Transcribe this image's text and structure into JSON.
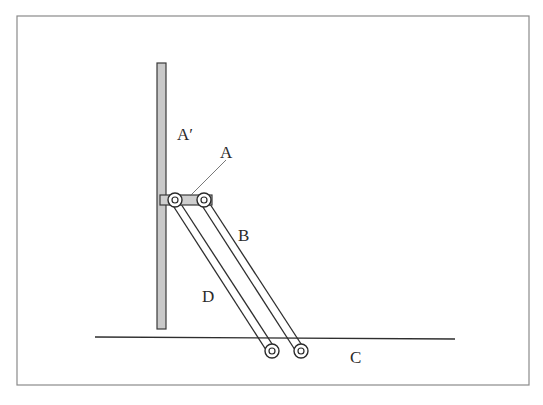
{
  "diagram": {
    "type": "mechanical-linkage",
    "labels": {
      "a_prime": "A′",
      "a": "A",
      "b": "B",
      "c": "C",
      "d": "D"
    },
    "parts": [
      {
        "id": "A'",
        "description": "vertical post / guide"
      },
      {
        "id": "A",
        "description": "slider block on post"
      },
      {
        "id": "B",
        "description": "outer link"
      },
      {
        "id": "D",
        "description": "inner link"
      },
      {
        "id": "C",
        "description": "ground line"
      }
    ],
    "colors": {
      "stroke": "#2e2e2e",
      "fill_gray": "#c9c9c9",
      "frame": "#8a8a8a"
    }
  }
}
